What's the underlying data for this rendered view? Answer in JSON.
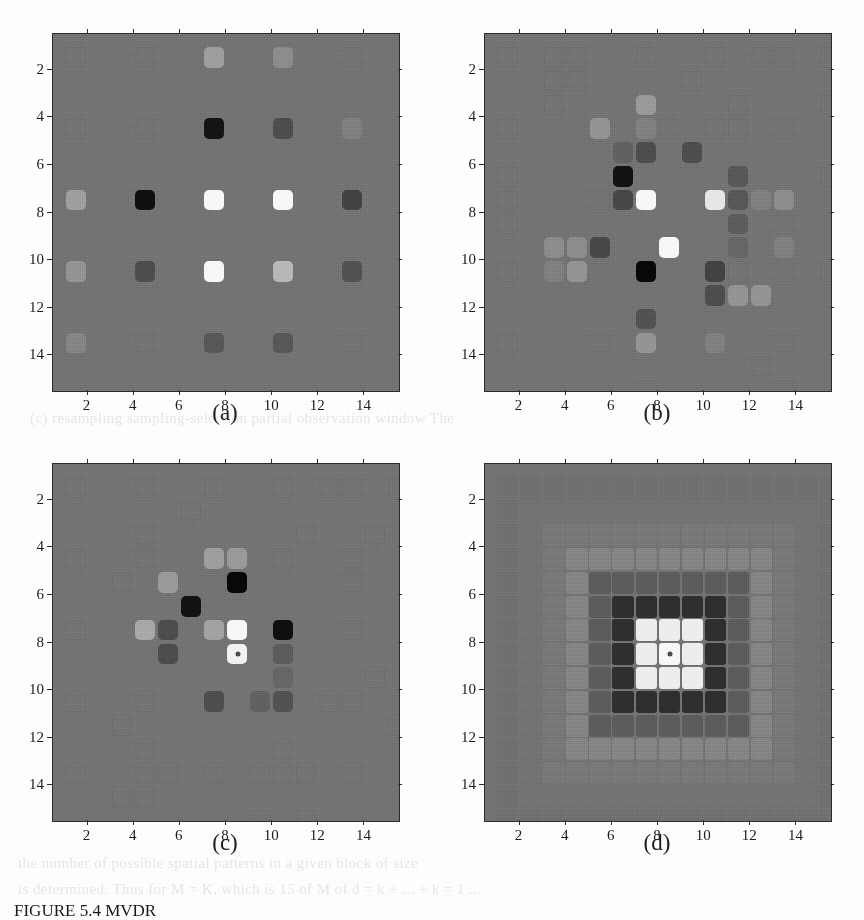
{
  "figure": {
    "caption_prefix": "FIGURE",
    "caption_number": "5.4",
    "caption_text": "FIGURE 5.4  MVDR"
  },
  "bleed_text": {
    "line1": "(c) resampling    sampling-selection          partial observation window  The",
    "line2": "the number of possible spatial patterns in a given block of size",
    "line3": "is determined. Thus for M = K, which is 15 of M of  d = k + ...  +  k = 1 ..."
  },
  "axis": {
    "x_ticks": [
      "2",
      "4",
      "6",
      "8",
      "10",
      "12",
      "14"
    ],
    "y_ticks": [
      "2",
      "4",
      "6",
      "8",
      "10",
      "12",
      "14"
    ],
    "x_min": 0.5,
    "x_max": 15.5,
    "y_min": 0.5,
    "y_max": 15.5
  },
  "colors": {
    "background_gray": "#8d8d8d",
    "axis_line": "#2b2b2b",
    "outline_cell": "#6f6f6f",
    "page": "#fdfdfc",
    "marker": "#4a4a4a"
  },
  "panels": [
    {
      "id": "a",
      "label": "(a)",
      "description": "uniform 5x5 sparse array",
      "grid": 15,
      "style": "rounded",
      "marker": null
    },
    {
      "id": "b",
      "label": "(b)",
      "description": "randomized sampling pattern",
      "grid": 15,
      "style": "rounded",
      "marker": null
    },
    {
      "id": "c",
      "label": "(c)",
      "description": "optimized sampling pattern",
      "grid": 15,
      "style": "rounded",
      "marker": {
        "x": 8,
        "y": 8
      }
    },
    {
      "id": "d",
      "label": "(d)",
      "description": "full dense grid beampattern",
      "grid": 15,
      "style": "dense",
      "marker": {
        "x": 8,
        "y": 8
      }
    }
  ],
  "chart_data": {
    "type": "heatmap",
    "title": "",
    "xlabel": "",
    "ylabel": "",
    "grid_size": 15,
    "xlim": [
      0.5,
      15.5
    ],
    "ylim": [
      0.5,
      15.5
    ],
    "xticks": [
      2,
      4,
      6,
      8,
      10,
      12,
      14
    ],
    "yticks": [
      2,
      4,
      6,
      8,
      10,
      12,
      14
    ],
    "y_axis_inverted": true,
    "background_level": 0.45,
    "colormap": "gray",
    "panels": [
      {
        "id": "a",
        "label": "(a)",
        "cells": [
          {
            "x": 1,
            "y": 1,
            "v": 0.45
          },
          {
            "x": 4,
            "y": 1,
            "v": 0.45
          },
          {
            "x": 7,
            "y": 1,
            "v": 0.62
          },
          {
            "x": 10,
            "y": 1,
            "v": 0.55
          },
          {
            "x": 13,
            "y": 1,
            "v": 0.45
          },
          {
            "x": 1,
            "y": 4,
            "v": 0.45
          },
          {
            "x": 4,
            "y": 4,
            "v": 0.45
          },
          {
            "x": 7,
            "y": 4,
            "v": 0.08
          },
          {
            "x": 10,
            "y": 4,
            "v": 0.3
          },
          {
            "x": 13,
            "y": 4,
            "v": 0.5
          },
          {
            "x": 1,
            "y": 7,
            "v": 0.62
          },
          {
            "x": 4,
            "y": 7,
            "v": 0.06
          },
          {
            "x": 7,
            "y": 7,
            "v": 0.97
          },
          {
            "x": 10,
            "y": 7,
            "v": 0.97
          },
          {
            "x": 13,
            "y": 7,
            "v": 0.26
          },
          {
            "x": 1,
            "y": 10,
            "v": 0.58
          },
          {
            "x": 4,
            "y": 10,
            "v": 0.3
          },
          {
            "x": 7,
            "y": 10,
            "v": 0.97
          },
          {
            "x": 10,
            "y": 10,
            "v": 0.72
          },
          {
            "x": 13,
            "y": 10,
            "v": 0.32
          },
          {
            "x": 1,
            "y": 13,
            "v": 0.52
          },
          {
            "x": 4,
            "y": 13,
            "v": 0.48
          },
          {
            "x": 7,
            "y": 13,
            "v": 0.34
          },
          {
            "x": 10,
            "y": 13,
            "v": 0.34
          },
          {
            "x": 13,
            "y": 13,
            "v": 0.48
          }
        ]
      },
      {
        "id": "b",
        "label": "(b)",
        "cells": [
          {
            "x": 1,
            "y": 1,
            "v": 0.45
          },
          {
            "x": 3,
            "y": 1,
            "v": 0.45
          },
          {
            "x": 4,
            "y": 1,
            "v": 0.45
          },
          {
            "x": 7,
            "y": 1,
            "v": 0.45
          },
          {
            "x": 10,
            "y": 1,
            "v": 0.45
          },
          {
            "x": 12,
            "y": 1,
            "v": 0.45
          },
          {
            "x": 13,
            "y": 1,
            "v": 0.45
          },
          {
            "x": 15,
            "y": 1,
            "v": 0.45
          },
          {
            "x": 3,
            "y": 2,
            "v": 0.45
          },
          {
            "x": 4,
            "y": 2,
            "v": 0.45
          },
          {
            "x": 9,
            "y": 2,
            "v": 0.45
          },
          {
            "x": 3,
            "y": 3,
            "v": 0.45
          },
          {
            "x": 7,
            "y": 3,
            "v": 0.6
          },
          {
            "x": 11,
            "y": 3,
            "v": 0.45
          },
          {
            "x": 15,
            "y": 3,
            "v": 0.45
          },
          {
            "x": 1,
            "y": 4,
            "v": 0.45
          },
          {
            "x": 5,
            "y": 4,
            "v": 0.58
          },
          {
            "x": 7,
            "y": 4,
            "v": 0.5
          },
          {
            "x": 8,
            "y": 4,
            "v": 0.45
          },
          {
            "x": 10,
            "y": 4,
            "v": 0.45
          },
          {
            "x": 11,
            "y": 4,
            "v": 0.45
          },
          {
            "x": 13,
            "y": 4,
            "v": 0.45
          },
          {
            "x": 6,
            "y": 5,
            "v": 0.38
          },
          {
            "x": 7,
            "y": 5,
            "v": 0.3
          },
          {
            "x": 9,
            "y": 5,
            "v": 0.3
          },
          {
            "x": 1,
            "y": 6,
            "v": 0.45
          },
          {
            "x": 6,
            "y": 6,
            "v": 0.07
          },
          {
            "x": 11,
            "y": 6,
            "v": 0.34
          },
          {
            "x": 15,
            "y": 6,
            "v": 0.45
          },
          {
            "x": 1,
            "y": 7,
            "v": 0.45
          },
          {
            "x": 5,
            "y": 7,
            "v": 0.45
          },
          {
            "x": 6,
            "y": 7,
            "v": 0.28
          },
          {
            "x": 7,
            "y": 7,
            "v": 0.97
          },
          {
            "x": 10,
            "y": 7,
            "v": 0.9
          },
          {
            "x": 11,
            "y": 7,
            "v": 0.34
          },
          {
            "x": 12,
            "y": 7,
            "v": 0.5
          },
          {
            "x": 13,
            "y": 7,
            "v": 0.55
          },
          {
            "x": 1,
            "y": 8,
            "v": 0.45
          },
          {
            "x": 11,
            "y": 8,
            "v": 0.36
          },
          {
            "x": 13,
            "y": 8,
            "v": 0.45
          },
          {
            "x": 3,
            "y": 9,
            "v": 0.55
          },
          {
            "x": 4,
            "y": 9,
            "v": 0.55
          },
          {
            "x": 5,
            "y": 9,
            "v": 0.28
          },
          {
            "x": 8,
            "y": 9,
            "v": 0.97
          },
          {
            "x": 11,
            "y": 9,
            "v": 0.4
          },
          {
            "x": 13,
            "y": 9,
            "v": 0.5
          },
          {
            "x": 1,
            "y": 10,
            "v": 0.45
          },
          {
            "x": 3,
            "y": 10,
            "v": 0.5
          },
          {
            "x": 4,
            "y": 10,
            "v": 0.58
          },
          {
            "x": 7,
            "y": 10,
            "v": 0.03
          },
          {
            "x": 10,
            "y": 10,
            "v": 0.26
          },
          {
            "x": 11,
            "y": 10,
            "v": 0.45
          },
          {
            "x": 13,
            "y": 10,
            "v": 0.45
          },
          {
            "x": 15,
            "y": 10,
            "v": 0.45
          },
          {
            "x": 10,
            "y": 11,
            "v": 0.3
          },
          {
            "x": 11,
            "y": 11,
            "v": 0.58
          },
          {
            "x": 12,
            "y": 11,
            "v": 0.58
          },
          {
            "x": 7,
            "y": 12,
            "v": 0.32
          },
          {
            "x": 1,
            "y": 13,
            "v": 0.45
          },
          {
            "x": 5,
            "y": 13,
            "v": 0.45
          },
          {
            "x": 7,
            "y": 13,
            "v": 0.58
          },
          {
            "x": 10,
            "y": 13,
            "v": 0.5
          },
          {
            "x": 13,
            "y": 13,
            "v": 0.45
          },
          {
            "x": 12,
            "y": 14,
            "v": 0.45
          },
          {
            "x": 7,
            "y": 15,
            "v": 0.45
          },
          {
            "x": 13,
            "y": 15,
            "v": 0.45
          }
        ]
      },
      {
        "id": "c",
        "label": "(c)",
        "cells": [
          {
            "x": 1,
            "y": 1,
            "v": 0.45
          },
          {
            "x": 4,
            "y": 1,
            "v": 0.45
          },
          {
            "x": 7,
            "y": 1,
            "v": 0.45
          },
          {
            "x": 10,
            "y": 1,
            "v": 0.45
          },
          {
            "x": 12,
            "y": 1,
            "v": 0.45
          },
          {
            "x": 13,
            "y": 1,
            "v": 0.45
          },
          {
            "x": 15,
            "y": 1,
            "v": 0.45
          },
          {
            "x": 6,
            "y": 2,
            "v": 0.45
          },
          {
            "x": 4,
            "y": 3,
            "v": 0.45
          },
          {
            "x": 11,
            "y": 3,
            "v": 0.45
          },
          {
            "x": 14,
            "y": 3,
            "v": 0.45
          },
          {
            "x": 1,
            "y": 4,
            "v": 0.45
          },
          {
            "x": 4,
            "y": 4,
            "v": 0.45
          },
          {
            "x": 7,
            "y": 4,
            "v": 0.62
          },
          {
            "x": 8,
            "y": 4,
            "v": 0.6
          },
          {
            "x": 10,
            "y": 4,
            "v": 0.45
          },
          {
            "x": 13,
            "y": 4,
            "v": 0.45
          },
          {
            "x": 3,
            "y": 5,
            "v": 0.45
          },
          {
            "x": 5,
            "y": 5,
            "v": 0.6
          },
          {
            "x": 8,
            "y": 5,
            "v": 0.03
          },
          {
            "x": 13,
            "y": 5,
            "v": 0.45
          },
          {
            "x": 6,
            "y": 6,
            "v": 0.07
          },
          {
            "x": 1,
            "y": 7,
            "v": 0.45
          },
          {
            "x": 4,
            "y": 7,
            "v": 0.66
          },
          {
            "x": 5,
            "y": 7,
            "v": 0.3
          },
          {
            "x": 7,
            "y": 7,
            "v": 0.64
          },
          {
            "x": 8,
            "y": 7,
            "v": 0.97
          },
          {
            "x": 10,
            "y": 7,
            "v": 0.06
          },
          {
            "x": 13,
            "y": 7,
            "v": 0.45
          },
          {
            "x": 5,
            "y": 8,
            "v": 0.3
          },
          {
            "x": 8,
            "y": 8,
            "v": 0.95
          },
          {
            "x": 10,
            "y": 8,
            "v": 0.36
          },
          {
            "x": 10,
            "y": 9,
            "v": 0.4
          },
          {
            "x": 14,
            "y": 9,
            "v": 0.45
          },
          {
            "x": 1,
            "y": 10,
            "v": 0.45
          },
          {
            "x": 4,
            "y": 10,
            "v": 0.45
          },
          {
            "x": 7,
            "y": 10,
            "v": 0.3
          },
          {
            "x": 9,
            "y": 10,
            "v": 0.38
          },
          {
            "x": 10,
            "y": 10,
            "v": 0.32
          },
          {
            "x": 12,
            "y": 10,
            "v": 0.45
          },
          {
            "x": 13,
            "y": 10,
            "v": 0.45
          },
          {
            "x": 3,
            "y": 11,
            "v": 0.45
          },
          {
            "x": 15,
            "y": 11,
            "v": 0.45
          },
          {
            "x": 4,
            "y": 12,
            "v": 0.45
          },
          {
            "x": 10,
            "y": 12,
            "v": 0.45
          },
          {
            "x": 1,
            "y": 13,
            "v": 0.45
          },
          {
            "x": 4,
            "y": 13,
            "v": 0.45
          },
          {
            "x": 5,
            "y": 13,
            "v": 0.45
          },
          {
            "x": 7,
            "y": 13,
            "v": 0.45
          },
          {
            "x": 9,
            "y": 13,
            "v": 0.45
          },
          {
            "x": 10,
            "y": 13,
            "v": 0.45
          },
          {
            "x": 11,
            "y": 13,
            "v": 0.45
          },
          {
            "x": 13,
            "y": 13,
            "v": 0.45
          },
          {
            "x": 3,
            "y": 14,
            "v": 0.45
          },
          {
            "x": 4,
            "y": 14,
            "v": 0.45
          },
          {
            "x": 9,
            "y": 15,
            "v": 0.45
          },
          {
            "x": 11,
            "y": 15,
            "v": 0.45
          }
        ],
        "marker": {
          "x": 8,
          "y": 8
        }
      },
      {
        "id": "d",
        "label": "(d)",
        "note": "dense 15x15 grid, radially symmetric lobe pattern centered at (8,8)",
        "rings": [
          {
            "radius": 0,
            "v": 0.97
          },
          {
            "radius": 1,
            "v": 0.93
          },
          {
            "radius": 2,
            "v": 0.18
          },
          {
            "radius": 3,
            "v": 0.36
          },
          {
            "radius": 4,
            "v": 0.52
          },
          {
            "radius": 5,
            "v": 0.47
          },
          {
            "radius": 6,
            "v": 0.45
          },
          {
            "radius": 7,
            "v": 0.44
          }
        ],
        "marker": {
          "x": 8,
          "y": 8
        }
      }
    ]
  }
}
